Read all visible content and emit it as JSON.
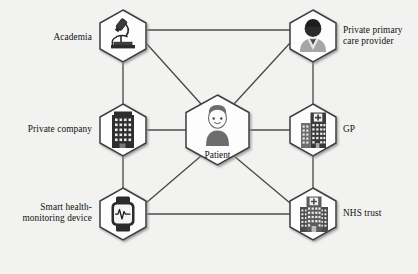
{
  "figure": {
    "background_color": "#f2f2f0",
    "hex_fill": "#fdfdfd",
    "hex_stroke": "#3c3c3c",
    "edge_color": "#4a4a4a",
    "center_node": {
      "id": "patient",
      "label": "Patient",
      "icon": "person-icon"
    }
  },
  "nodes": [
    {
      "id": "academia",
      "label": "Academia",
      "icon": "microscope-icon",
      "label_side": "left",
      "x": 123,
      "y": 36
    },
    {
      "id": "private-company",
      "label": "Private company",
      "icon": "office-building-icon",
      "label_side": "left",
      "x": 123,
      "y": 130
    },
    {
      "id": "smart-health-monitoring-device",
      "label": "Smart health-\nmonitoring device",
      "icon": "smartwatch-icon",
      "label_side": "left",
      "x": 123,
      "y": 214
    },
    {
      "id": "private-primary-care-provider",
      "label": "Private primary\ncare provider",
      "icon": "doctor-person-icon",
      "label_side": "right",
      "x": 313,
      "y": 36
    },
    {
      "id": "gp",
      "label": "GP",
      "icon": "clinic-building-icon",
      "label_side": "right",
      "x": 313,
      "y": 130
    },
    {
      "id": "nhs-trust",
      "label": "NHS trust",
      "icon": "hospital-building-icon",
      "label_side": "right",
      "x": 313,
      "y": 214
    }
  ],
  "edges": [
    {
      "from": "academia",
      "to": "private-company"
    },
    {
      "from": "academia",
      "to": "private-primary-care-provider"
    },
    {
      "from": "academia",
      "to": "patient"
    },
    {
      "from": "private-company",
      "to": "smart-health-monitoring-device"
    },
    {
      "from": "private-company",
      "to": "patient"
    },
    {
      "from": "smart-health-monitoring-device",
      "to": "patient"
    },
    {
      "from": "smart-health-monitoring-device",
      "to": "nhs-trust"
    },
    {
      "from": "private-primary-care-provider",
      "to": "gp"
    },
    {
      "from": "private-primary-care-provider",
      "to": "patient"
    },
    {
      "from": "gp",
      "to": "patient"
    },
    {
      "from": "gp",
      "to": "nhs-trust"
    },
    {
      "from": "nhs-trust",
      "to": "patient"
    }
  ]
}
